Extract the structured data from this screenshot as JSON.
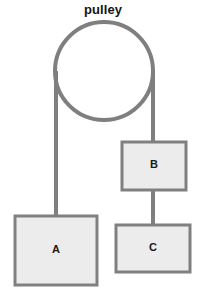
{
  "diagram": {
    "title": "pulley",
    "background_color": "#ffffff",
    "rope_color": "#7f7f7f",
    "pulley": {
      "name": "pulley-wheel",
      "shape": "circle",
      "center_x": 104,
      "center_y": 71,
      "radius": 49,
      "stroke_color": "#7f7f7f",
      "stroke_width": 4,
      "fill": "none"
    },
    "blocks": [
      {
        "id": "block-a",
        "label": "A",
        "x": 15,
        "y": 216,
        "width": 82,
        "height": 69,
        "fill_color": "#ececec",
        "border_color": "#808080"
      },
      {
        "id": "block-b",
        "label": "B",
        "x": 122,
        "y": 142,
        "width": 64,
        "height": 48,
        "fill_color": "#ececec",
        "border_color": "#808080"
      },
      {
        "id": "block-c",
        "label": "C",
        "x": 116,
        "y": 225,
        "width": 74,
        "height": 47,
        "fill_color": "#ececec",
        "border_color": "#808080"
      }
    ],
    "ropes": [
      {
        "id": "rope-pulley-to-a",
        "from": "pulley-left-tangent",
        "to": "block-a",
        "x": 56,
        "y_start": 71,
        "y_end": 218,
        "width": 4,
        "color": "#7f7f7f"
      },
      {
        "id": "rope-pulley-to-b",
        "from": "pulley-right-tangent",
        "to": "block-b",
        "x": 153,
        "y_start": 71,
        "y_end": 144,
        "width": 4,
        "color": "#7f7f7f"
      },
      {
        "id": "rope-b-to-c",
        "from": "block-b",
        "to": "block-c",
        "x": 153,
        "y_start": 189,
        "y_end": 227,
        "width": 4,
        "color": "#7f7f7f"
      }
    ]
  }
}
